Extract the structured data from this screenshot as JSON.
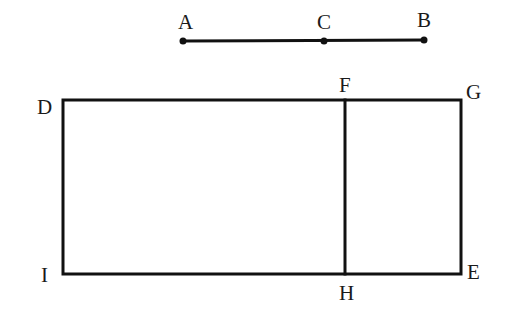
{
  "diagram": {
    "segment": {
      "points": [
        {
          "name": "A",
          "x": 183,
          "y": 41
        },
        {
          "name": "C",
          "x": 324,
          "y": 41
        },
        {
          "name": "B",
          "x": 424,
          "y": 40
        }
      ]
    },
    "rectangle": {
      "vertices": {
        "D": {
          "x": 63,
          "y": 100
        },
        "G": {
          "x": 461,
          "y": 100
        },
        "E": {
          "x": 461,
          "y": 274
        },
        "I": {
          "x": 63,
          "y": 274
        }
      },
      "divider": {
        "F": {
          "x": 345,
          "y": 100
        },
        "H": {
          "x": 345,
          "y": 274
        }
      }
    },
    "labels": {
      "A": "A",
      "B": "B",
      "C": "C",
      "D": "D",
      "E": "E",
      "F": "F",
      "G": "G",
      "H": "H",
      "I": "I"
    },
    "colors": {
      "stroke": "#111111",
      "background": "#ffffff"
    }
  }
}
